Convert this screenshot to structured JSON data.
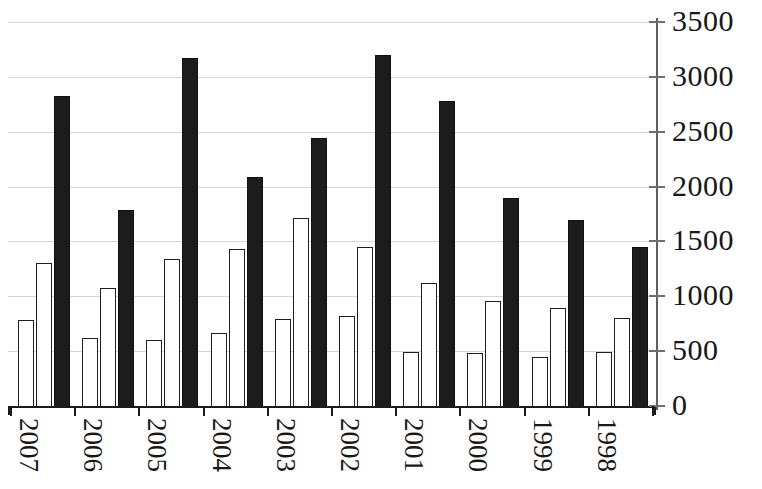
{
  "chart_data": {
    "type": "bar",
    "title": "",
    "subtitle": "",
    "xlabel": "",
    "ylabel": "",
    "categories": [
      "2007",
      "2006",
      "2005",
      "2004",
      "2003",
      "2002",
      "2001",
      "2000",
      "1999",
      "1998"
    ],
    "series": [
      {
        "name": "series-1",
        "style": "white",
        "values": [
          780,
          620,
          600,
          670,
          790,
          820,
          490,
          480,
          450,
          490
        ]
      },
      {
        "name": "series-2",
        "style": "white",
        "values": [
          1300,
          1080,
          1340,
          1430,
          1710,
          1450,
          1120,
          960,
          890,
          800
        ]
      },
      {
        "name": "series-3",
        "style": "black",
        "values": [
          2830,
          1790,
          3170,
          2090,
          2440,
          3200,
          2780,
          1900,
          1700,
          1450
        ]
      }
    ],
    "ylim": [
      0,
      3500
    ],
    "ytick_values": [
      0,
      500,
      1000,
      1500,
      2000,
      2500,
      3000,
      3500
    ],
    "ytick_labels": [
      "0",
      "500",
      "1000",
      "1500",
      "2000",
      "2500",
      "3000",
      "3500"
    ],
    "grid": true,
    "grid_axis": "y",
    "grid_color": "#b9bcc4",
    "legend": "none",
    "legend_position": "none",
    "colors": {
      "series_white_fill": "#ffffff",
      "series_white_stroke": "#1f1f1f",
      "series_black_fill": "#1c1c1c",
      "axis": "#1a1a1a",
      "text": "#181818",
      "background": "#ffffff"
    },
    "annotations": []
  }
}
